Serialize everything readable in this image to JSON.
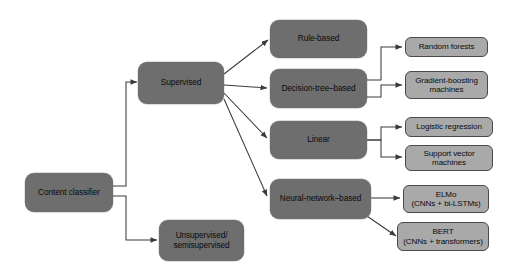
{
  "diagram": {
    "colors": {
      "background": "#ffffff",
      "primary_node_fill": "#6e6e6e",
      "leaf_node_fill": "#a9a9a9",
      "leaf_node_border": "#4a4a4a",
      "edge": "#3a3a3a",
      "text": "#0b0b0b"
    },
    "nodes": {
      "root": "Content classifier",
      "supervised": "Supervised",
      "unsupervised": "Unsupervised/\nsemisupervised",
      "rule_based": "Rule-based",
      "decision_tree": "Decision-tree–based",
      "linear": "Linear",
      "neural_network": "Neural-network–based",
      "random_forests": "Random forests",
      "gradient_boosting": "Gradient-boosting\nmachines",
      "logistic_regression": "Logistic regression",
      "support_vector": "Support vector\nmachines",
      "elmo": "ELMo\n(CNNs + bi-LSTMs)",
      "bert": "BERT\n(CNNs + transformers)"
    }
  }
}
